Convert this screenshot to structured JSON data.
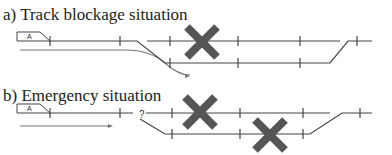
{
  "colors": {
    "track": "#444444",
    "route": "#777777",
    "cross": "#555555",
    "text": "#222222"
  },
  "panels": [
    {
      "id": "a",
      "title": "a) Track blockage situation",
      "title_top": 6,
      "train": {
        "label": "A",
        "x": 17,
        "y": 32,
        "w": 33,
        "h": 9
      },
      "question_mark": null,
      "tracks": [
        {
          "points": [
            [
              50,
              41
            ],
            [
              137,
              41
            ],
            [
              165,
              63
            ],
            [
              330,
              63
            ],
            [
              348,
              41
            ],
            [
              372,
              41
            ]
          ]
        },
        {
          "points": [
            [
              147,
              41
            ],
            [
              340,
              41
            ]
          ]
        }
      ],
      "ticks": [
        [
          50,
          41
        ],
        [
          120,
          41
        ],
        [
          170,
          41
        ],
        [
          238,
          41
        ],
        [
          300,
          41
        ],
        [
          357,
          41
        ],
        [
          170,
          63
        ],
        [
          238,
          63
        ],
        [
          300,
          63
        ]
      ],
      "route": {
        "d": "M20 50 L125 50 Q150 50 165 63 Q178 75 190 75 L188 75",
        "arrow_to": [
          190,
          76
        ]
      },
      "crosses": [
        {
          "cx": 202,
          "cy": 42,
          "size": 15
        }
      ]
    },
    {
      "id": "b",
      "title": "b) Emergency situation",
      "title_top": 87,
      "train": {
        "label": "A",
        "x": 17,
        "y": 104,
        "w": 33,
        "h": 9
      },
      "question_mark": {
        "text": "?",
        "x": 139,
        "y": 118
      },
      "tracks": [
        {
          "points": [
            [
              50,
              113
            ],
            [
              133,
              113
            ]
          ]
        },
        {
          "points": [
            [
              146,
              113
            ],
            [
              330,
              113
            ]
          ]
        },
        {
          "points": [
            [
              140,
              119
            ],
            [
              165,
              134
            ],
            [
              310,
              134
            ],
            [
              342,
              113
            ],
            [
              372,
              113
            ]
          ]
        }
      ],
      "ticks": [
        [
          50,
          113
        ],
        [
          120,
          113
        ],
        [
          172,
          113
        ],
        [
          240,
          113
        ],
        [
          303,
          113
        ],
        [
          360,
          113
        ],
        [
          172,
          134
        ],
        [
          240,
          134
        ],
        [
          303,
          134
        ]
      ],
      "route": {
        "d": "M20 126 L110 126",
        "arrow_to": [
          113,
          126
        ]
      },
      "crosses": [
        {
          "cx": 200,
          "cy": 112,
          "size": 15
        },
        {
          "cx": 270,
          "cy": 135,
          "size": 15
        }
      ]
    }
  ]
}
